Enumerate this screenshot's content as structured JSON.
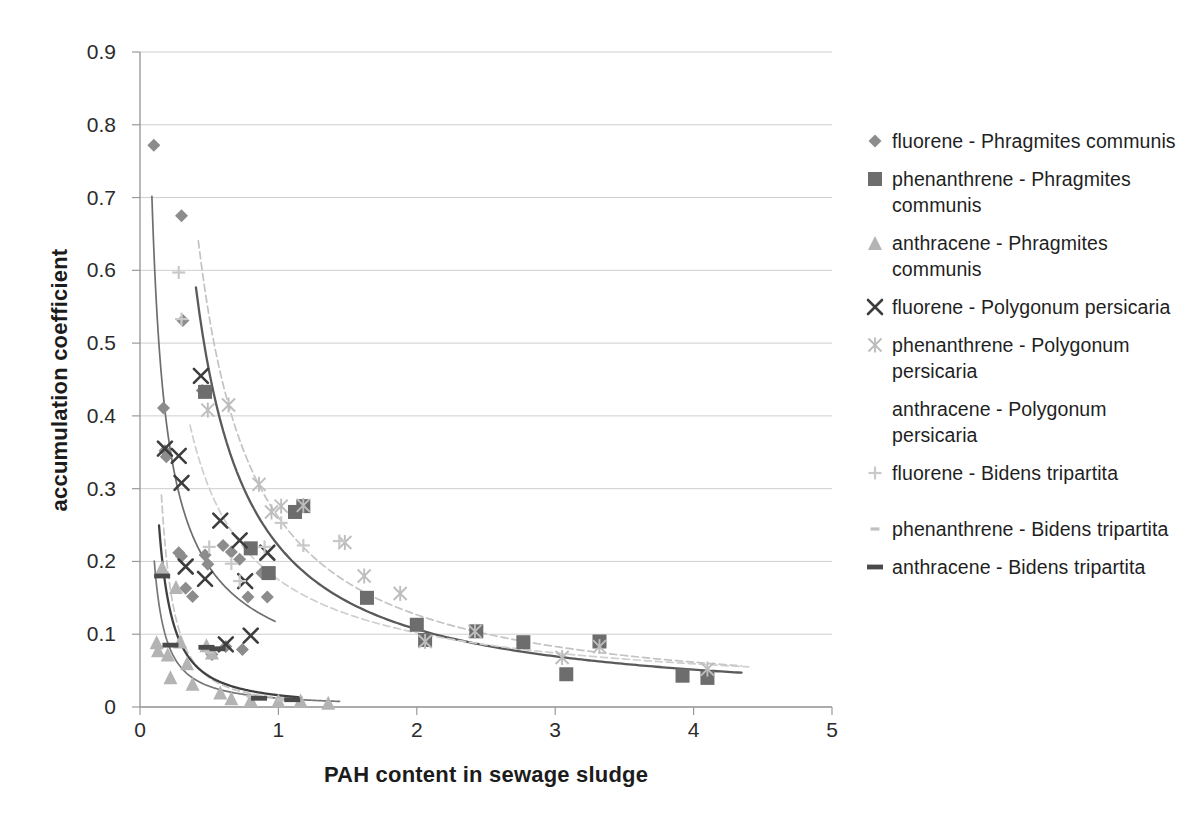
{
  "chart_data": {
    "type": "scatter",
    "title": "",
    "xlabel": "PAH content in sewage sludge",
    "ylabel": "accumulation coefficient",
    "xlim": [
      0,
      5
    ],
    "ylim": [
      0,
      0.9
    ],
    "xticks": [
      "0",
      "1",
      "2",
      "3",
      "4",
      "5"
    ],
    "xtick_values": [
      0,
      1,
      2,
      3,
      4,
      5
    ],
    "yticks": [
      "0",
      "0.1",
      "0.2",
      "0.3",
      "0.4",
      "0.5",
      "0.6",
      "0.7",
      "0.8",
      "0.9"
    ],
    "ytick_values": [
      0,
      0.1,
      0.2,
      0.3,
      0.4,
      0.5,
      0.6,
      0.7,
      0.8,
      0.9
    ],
    "grid": "horizontal",
    "legend_position": "right",
    "series": [
      {
        "name": "fluorene - Phragmites communis",
        "marker": "diamond",
        "color": "#8c8c8c",
        "trendline": true,
        "trendline_color": "#6e6e6e",
        "points": [
          [
            0.1,
            0.772
          ],
          [
            0.18,
            0.352
          ],
          [
            0.19,
            0.344
          ],
          [
            0.17,
            0.411
          ],
          [
            0.3,
            0.675
          ],
          [
            0.31,
            0.531
          ],
          [
            0.28,
            0.212
          ],
          [
            0.3,
            0.207
          ],
          [
            0.33,
            0.163
          ],
          [
            0.38,
            0.152
          ],
          [
            0.45,
            0.435
          ],
          [
            0.47,
            0.209
          ],
          [
            0.49,
            0.196
          ],
          [
            0.52,
            0.072
          ],
          [
            0.6,
            0.222
          ],
          [
            0.62,
            0.083
          ],
          [
            0.66,
            0.213
          ],
          [
            0.72,
            0.203
          ],
          [
            0.74,
            0.079
          ],
          [
            0.78,
            0.151
          ],
          [
            0.88,
            0.184
          ],
          [
            0.92,
            0.151
          ]
        ]
      },
      {
        "name": "phenanthrene - Phragmites communis",
        "marker": "square",
        "color": "#6d6d6d",
        "trendline": true,
        "trendline_color": "#5a5a5a",
        "points": [
          [
            0.47,
            0.433
          ],
          [
            0.8,
            0.218
          ],
          [
            0.93,
            0.184
          ],
          [
            1.12,
            0.268
          ],
          [
            1.18,
            0.276
          ],
          [
            1.64,
            0.15
          ],
          [
            2.0,
            0.113
          ],
          [
            2.06,
            0.092
          ],
          [
            2.43,
            0.104
          ],
          [
            2.77,
            0.089
          ],
          [
            3.08,
            0.045
          ],
          [
            3.32,
            0.09
          ],
          [
            3.92,
            0.043
          ],
          [
            4.1,
            0.04
          ]
        ]
      },
      {
        "name": "anthracene - Phragmites communis",
        "marker": "triangle",
        "color": "#b4b4b4",
        "trendline": true,
        "trendline_color": "#777777",
        "points": [
          [
            0.12,
            0.089
          ],
          [
            0.13,
            0.078
          ],
          [
            0.16,
            0.192
          ],
          [
            0.2,
            0.072
          ],
          [
            0.22,
            0.041
          ],
          [
            0.26,
            0.165
          ],
          [
            0.29,
            0.09
          ],
          [
            0.34,
            0.06
          ],
          [
            0.38,
            0.032
          ],
          [
            0.48,
            0.085
          ],
          [
            0.52,
            0.075
          ],
          [
            0.58,
            0.02
          ],
          [
            0.66,
            0.012
          ],
          [
            0.8,
            0.01
          ],
          [
            1.0,
            0.009
          ],
          [
            1.16,
            0.009
          ],
          [
            1.36,
            0.006
          ]
        ]
      },
      {
        "name": "fluorene - Polygonum persicaria",
        "marker": "x",
        "color": "#3d3d3d",
        "trendline": false,
        "points": [
          [
            0.18,
            0.355
          ],
          [
            0.28,
            0.345
          ],
          [
            0.3,
            0.308
          ],
          [
            0.33,
            0.193
          ],
          [
            0.44,
            0.455
          ],
          [
            0.47,
            0.176
          ],
          [
            0.58,
            0.256
          ],
          [
            0.62,
            0.086
          ],
          [
            0.72,
            0.229
          ],
          [
            0.76,
            0.173
          ],
          [
            0.8,
            0.098
          ],
          [
            0.92,
            0.212
          ]
        ]
      },
      {
        "name": "phenanthrene - Polygonum persicaria",
        "marker": "asterisk",
        "color": "#bdbdbd",
        "trendline": true,
        "trendline_color": "#c3c3c3",
        "points": [
          [
            0.49,
            0.408
          ],
          [
            0.64,
            0.415
          ],
          [
            0.86,
            0.306
          ],
          [
            0.95,
            0.268
          ],
          [
            1.02,
            0.276
          ],
          [
            1.18,
            0.277
          ],
          [
            1.48,
            0.226
          ],
          [
            1.62,
            0.18
          ],
          [
            1.88,
            0.156
          ],
          [
            2.06,
            0.09
          ],
          [
            2.42,
            0.104
          ],
          [
            3.05,
            0.068
          ],
          [
            3.32,
            0.083
          ],
          [
            4.1,
            0.052
          ]
        ]
      },
      {
        "name": "anthracene - Polygonum persicaria",
        "marker": "none",
        "color": "#cccccc",
        "trendline": true,
        "trendline_color": "#cfcfcf",
        "points": []
      },
      {
        "name": "fluorene - Bidens tripartita",
        "marker": "plus",
        "color": "#c9c9c9",
        "trendline": false,
        "points": [
          [
            0.28,
            0.597
          ],
          [
            0.3,
            0.533
          ],
          [
            0.5,
            0.22
          ],
          [
            0.66,
            0.197
          ],
          [
            0.72,
            0.173
          ],
          [
            0.9,
            0.22
          ],
          [
            1.02,
            0.253
          ],
          [
            1.18,
            0.222
          ],
          [
            1.44,
            0.228
          ]
        ]
      },
      {
        "name": "phenanthrene - Bidens tripartita",
        "marker": "dash-small",
        "color": "#c0c0c0",
        "trendline": true,
        "trendline_color": "#c6c6c6",
        "points": [
          [
            0.18,
            0.18
          ],
          [
            0.5,
            0.075
          ],
          [
            0.8,
            0.015
          ],
          [
            1.02,
            0.01
          ]
        ]
      },
      {
        "name": "anthracene - Bidens tripartita",
        "marker": "dash",
        "color": "#4a4a4a",
        "trendline": true,
        "trendline_color": "#404040",
        "points": [
          [
            0.16,
            0.18
          ],
          [
            0.22,
            0.085
          ],
          [
            0.48,
            0.082
          ],
          [
            0.56,
            0.08
          ],
          [
            0.86,
            0.012
          ],
          [
            1.1,
            0.01
          ]
        ]
      }
    ]
  },
  "axis": {
    "x_title": "PAH content in sewage sludge",
    "y_title": "accumulation coefficient",
    "x_ticks": [
      "0",
      "1",
      "2",
      "3",
      "4",
      "5"
    ],
    "y_ticks": [
      "0",
      "0.1",
      "0.2",
      "0.3",
      "0.4",
      "0.5",
      "0.6",
      "0.7",
      "0.8",
      "0.9"
    ]
  },
  "legend": {
    "items": [
      {
        "label": "fluorene - Phragmites communis",
        "marker": "diamond",
        "color": "#8c8c8c"
      },
      {
        "label": "phenanthrene - Phragmites communis",
        "marker": "square",
        "color": "#6d6d6d"
      },
      {
        "label": "anthracene - Phragmites communis",
        "marker": "triangle",
        "color": "#b4b4b4"
      },
      {
        "label": "fluorene - Polygonum persicaria",
        "marker": "x",
        "color": "#3d3d3d"
      },
      {
        "label": "phenanthrene - Polygonum persicaria",
        "marker": "asterisk",
        "color": "#bdbdbd"
      },
      {
        "label": "anthracene - Polygonum persicaria",
        "marker": "none",
        "color": "#cccccc"
      },
      {
        "label": "fluorene - Bidens tripartita",
        "marker": "plus",
        "color": "#c9c9c9"
      },
      {
        "label": "phenanthrene - Bidens tripartita",
        "marker": "dash-small",
        "color": "#c0c0c0"
      },
      {
        "label": "anthracene - Bidens tripartita",
        "marker": "dash",
        "color": "#4a4a4a"
      }
    ]
  }
}
